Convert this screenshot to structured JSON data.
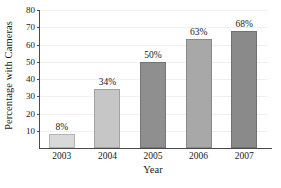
{
  "chart_data": {
    "type": "bar",
    "title": "",
    "subtitle": "",
    "xlabel": "Year",
    "ylabel": "Percentage with Cameras",
    "categories": [
      "2003",
      "2004",
      "2005",
      "2006",
      "2007"
    ],
    "values": [
      8,
      34,
      50,
      63,
      68
    ],
    "data_labels": [
      "8%",
      "34%",
      "50%",
      "63%",
      "68%"
    ],
    "bar_colors": [
      "#d9d9d9",
      "#c6c6c6",
      "#8f8f8f",
      "#a8a8a8",
      "#8a8a8a"
    ],
    "ylim": [
      0,
      80
    ],
    "xlim_note": "categorical",
    "yticks": [
      10,
      20,
      30,
      40,
      50,
      60,
      70,
      80
    ],
    "ytick_labels": [
      "10",
      "20",
      "30",
      "40",
      "50",
      "60",
      "70",
      "80"
    ],
    "grid": "horizontal-faint",
    "legend": "none",
    "legend_position": "none",
    "annotations": [],
    "series": [
      {
        "name": "Percentage with Cameras",
        "values": [
          8,
          34,
          50,
          63,
          68
        ]
      }
    ]
  },
  "axes": {
    "y_title": "Percentage with Cameras",
    "x_title": "Year"
  },
  "colors": {
    "axis": "#4a4a4a",
    "grid": "#f0f0f0",
    "text": "#1a1a1a",
    "background": "#ffffff"
  }
}
